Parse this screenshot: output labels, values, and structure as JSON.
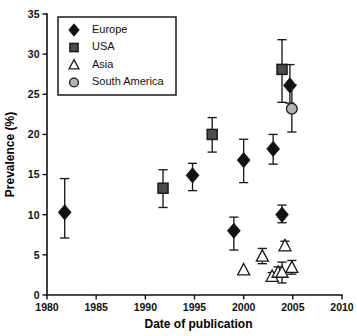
{
  "chart_data": {
    "type": "scatter",
    "title": "",
    "xlabel": "Date of publication",
    "ylabel": "Prevalence (%)",
    "xlim": [
      1980,
      2010
    ],
    "ylim": [
      0,
      35
    ],
    "xticks": [
      1980,
      1985,
      1990,
      1995,
      2000,
      2005,
      2010
    ],
    "yticks": [
      0,
      5,
      10,
      15,
      20,
      25,
      30,
      35
    ],
    "grid": false,
    "errorbars": true,
    "legend_position": "top-left",
    "series": [
      {
        "name": "Europe",
        "marker": "filled-diamond",
        "color": "#111111",
        "points": [
          {
            "x": 1981.8,
            "y": 10.3,
            "low": 7.1,
            "high": 14.5
          },
          {
            "x": 1994.8,
            "y": 14.9,
            "low": 13.0,
            "high": 16.4
          },
          {
            "x": 1999.0,
            "y": 8.0,
            "low": 5.6,
            "high": 9.7
          },
          {
            "x": 2000.0,
            "y": 16.8,
            "low": 14.0,
            "high": 19.4
          },
          {
            "x": 2003.0,
            "y": 18.2,
            "low": 16.3,
            "high": 20.0
          },
          {
            "x": 2003.9,
            "y": 10.0,
            "low": 9.0,
            "high": 11.2
          },
          {
            "x": 2004.7,
            "y": 26.1,
            "low": 23.9,
            "high": 28.7
          }
        ]
      },
      {
        "name": "USA",
        "marker": "filled-square",
        "color": "#4d4d4d",
        "points": [
          {
            "x": 1991.8,
            "y": 13.3,
            "low": 10.9,
            "high": 15.6
          },
          {
            "x": 1996.8,
            "y": 20.0,
            "low": 17.8,
            "high": 22.1
          },
          {
            "x": 2003.9,
            "y": 28.1,
            "low": 24.0,
            "high": 31.8
          }
        ]
      },
      {
        "name": "Asia",
        "marker": "open-triangle",
        "color": "#ffffff",
        "points": [
          {
            "x": 2000.0,
            "y": 3.1,
            "low": 3.1,
            "high": 3.1
          },
          {
            "x": 2001.9,
            "y": 4.8,
            "low": 3.9,
            "high": 5.8
          },
          {
            "x": 2002.9,
            "y": 2.3,
            "low": 1.8,
            "high": 2.8
          },
          {
            "x": 2003.5,
            "y": 2.8,
            "low": 2.2,
            "high": 3.5
          },
          {
            "x": 2003.9,
            "y": 2.8,
            "low": 1.5,
            "high": 4.1
          },
          {
            "x": 2004.2,
            "y": 6.1,
            "low": 5.6,
            "high": 6.7
          },
          {
            "x": 2004.9,
            "y": 3.4,
            "low": 2.6,
            "high": 4.3
          }
        ]
      },
      {
        "name": "South America",
        "marker": "filled-circle-gray",
        "color": "#b3b3b3",
        "points": [
          {
            "x": 2004.9,
            "y": 23.2,
            "low": 20.3,
            "high": 26.2
          }
        ]
      }
    ],
    "legend": [
      {
        "label": "Europe",
        "marker": "filled-diamond"
      },
      {
        "label": "USA",
        "marker": "filled-square"
      },
      {
        "label": "Asia",
        "marker": "open-triangle"
      },
      {
        "label": "South America",
        "marker": "filled-circle-gray"
      }
    ]
  }
}
